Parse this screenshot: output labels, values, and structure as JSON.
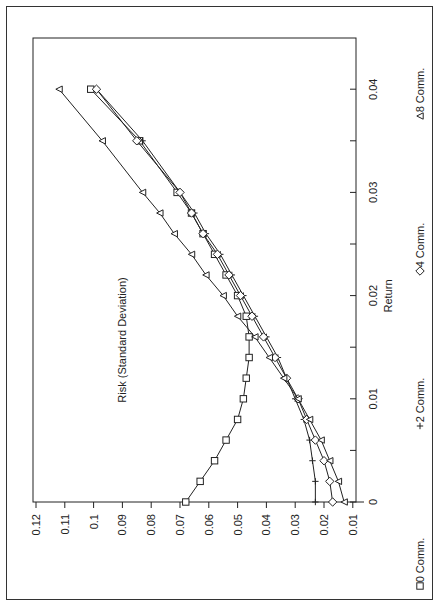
{
  "chart_data": {
    "type": "line",
    "title": "",
    "xlabel": "Return",
    "ylabel": "Risk (Standard Deviation)",
    "xlim": [
      0,
      0.04
    ],
    "ylim": [
      0.01,
      0.12
    ],
    "x_ticks": [
      "0",
      "0.01",
      "0.02",
      "0.03",
      "0.04"
    ],
    "y_ticks": [
      "0.01",
      "0.02",
      "0.03",
      "0.04",
      "0.05",
      "0.06",
      "0.07",
      "0.08",
      "0.09",
      "0.1",
      "0.11",
      "0.12"
    ],
    "orientation": "rotated 90 degrees clockwise",
    "legend_position": "bottom",
    "x": [
      0,
      0.002,
      0.004,
      0.006,
      0.008,
      0.01,
      0.012,
      0.014,
      0.016,
      0.018,
      0.02,
      0.022,
      0.024,
      0.026,
      0.028,
      0.03,
      0.035,
      0.04
    ],
    "series": [
      {
        "name": "0 Comm.",
        "marker": "square",
        "values": [
          0.068,
          0.063,
          0.058,
          0.054,
          0.05,
          0.048,
          0.047,
          0.046,
          0.046,
          0.047,
          0.05,
          0.054,
          0.058,
          0.062,
          0.066,
          0.071,
          0.084,
          0.101
        ]
      },
      {
        "name": "2 Comm.",
        "marker": "plus",
        "values": [
          0.023,
          0.023,
          0.024,
          0.025,
          0.027,
          0.03,
          0.033,
          0.036,
          0.04,
          0.044,
          0.048,
          0.052,
          0.056,
          0.061,
          0.065,
          0.07,
          0.083,
          0.099
        ]
      },
      {
        "name": "4 Comm.",
        "marker": "diamond",
        "values": [
          0.017,
          0.018,
          0.02,
          0.023,
          0.026,
          0.029,
          0.033,
          0.037,
          0.041,
          0.045,
          0.049,
          0.053,
          0.057,
          0.062,
          0.066,
          0.07,
          0.085,
          0.099
        ]
      },
      {
        "name": "8 Comm.",
        "marker": "triangle",
        "values": [
          0.013,
          0.015,
          0.018,
          0.021,
          0.025,
          0.029,
          0.034,
          0.039,
          0.044,
          0.05,
          0.055,
          0.061,
          0.066,
          0.072,
          0.077,
          0.083,
          0.097,
          0.112
        ]
      }
    ],
    "grid": false
  }
}
